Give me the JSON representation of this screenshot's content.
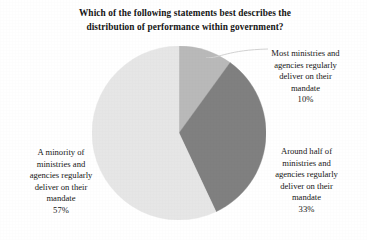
{
  "chart_data": {
    "type": "pie",
    "title": "Which of the following statements best describes the distribution of performance within government?",
    "title_lines": [
      "Which of the following statements best describes the",
      "distribution of performance within government?"
    ],
    "xlabel": "",
    "ylabel": "",
    "grid": false,
    "legend_position": "outside-callouts",
    "start_angle_deg": 0,
    "direction": "clockwise",
    "categories": [
      "Most ministries and agencies regularly deliver on their mandate",
      "Around half of ministries and agencies regularly deliver on their mandate",
      "A minority of ministries and agencies regularly deliver on their mandate"
    ],
    "values": [
      10,
      33,
      57
    ],
    "value_suffix": "%",
    "slices": [
      {
        "label": "Most ministries and agencies regularly deliver on their mandate",
        "label_lines": [
          "Most ministries and",
          "agencies regularly",
          "deliver on their",
          "mandate"
        ],
        "value": 10,
        "value_text": "10%",
        "color": "#b9b9b9",
        "start_deg": 0,
        "end_deg": 36
      },
      {
        "label": "Around half of ministries and agencies regularly deliver on their mandate",
        "label_lines": [
          "Around half of",
          "ministries and",
          "agencies regularly",
          "deliver on their",
          "mandate"
        ],
        "value": 33,
        "value_text": "33%",
        "color": "#808080",
        "start_deg": 36,
        "end_deg": 154.8
      },
      {
        "label": "A minority of ministries and agencies regularly deliver on their mandate",
        "label_lines": [
          "A minority of",
          "ministries and",
          "agencies regularly",
          "deliver on their",
          "mandate"
        ],
        "value": 57,
        "value_text": "57%",
        "color": "#e6e6e6",
        "start_deg": 154.8,
        "end_deg": 360
      }
    ],
    "colors": {
      "slice_most": "#b9b9b9",
      "slice_around": "#808080",
      "slice_minority": "#e6e6e6",
      "background": "#ffffff",
      "text": "#141414",
      "leader_line": "#cfcfcf"
    }
  },
  "labels": {
    "most": {
      "line1": "Most ministries and",
      "line2": "agencies regularly",
      "line3": "deliver on their",
      "line4": "mandate",
      "percent": "10%"
    },
    "around": {
      "line1": "Around half of",
      "line2": "ministries and",
      "line3": "agencies regularly",
      "line4": "deliver on their",
      "line5": "mandate",
      "percent": "33%"
    },
    "minority": {
      "line1": "A minority of",
      "line2": "ministries and",
      "line3": "agencies regularly",
      "line4": "deliver on their",
      "line5": "mandate",
      "percent": "57%"
    }
  },
  "title": {
    "line1": "Which of the following statements best describes the",
    "line2": "distribution of performance within government?"
  }
}
